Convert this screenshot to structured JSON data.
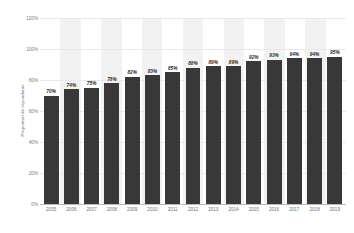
{
  "chart_data": {
    "type": "bar",
    "title": "",
    "subtitle": "",
    "xlabel": "",
    "ylabel": "Proportion de répondants",
    "categories": [
      "2005",
      "2006",
      "2007",
      "2008",
      "2009",
      "2010",
      "2011",
      "2012",
      "2013",
      "2014",
      "2015",
      "2016",
      "2017",
      "2018",
      "2019"
    ],
    "values": [
      70,
      74,
      75,
      78,
      82,
      83,
      85,
      88,
      89,
      89,
      92,
      93,
      94,
      94,
      95
    ],
    "value_labels": [
      "70%",
      "74%",
      "75%",
      "78%",
      "82%",
      "83%",
      "85%",
      "88%",
      "89%",
      "89%",
      "92%",
      "93%",
      "94%",
      "94%",
      "95%"
    ],
    "ylim": [
      0,
      120
    ],
    "ytick_values": [
      0,
      20,
      40,
      60,
      80,
      100,
      120
    ],
    "ytick_labels": [
      "0%",
      "20%",
      "40%",
      "60%",
      "80%",
      "100%",
      "120%"
    ],
    "grid": true,
    "legend": "none",
    "series_color": "#383838",
    "grid_color": "#e9e9e9",
    "band_color": "#f2f2f2",
    "background_color": "#ffffff",
    "axis_text_color": "#6f6f6f"
  }
}
